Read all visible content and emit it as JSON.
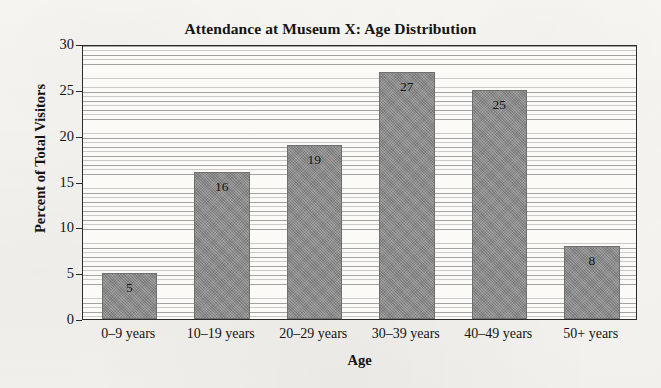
{
  "chart_data": {
    "type": "bar",
    "title": "Attendance at Museum X: Age Distribution",
    "xlabel": "Age",
    "ylabel": "Percent of Total Visitors",
    "categories": [
      "0–9 years",
      "10–19 years",
      "20–29 years",
      "30–39 years",
      "40–49 years",
      "50+ years"
    ],
    "values": [
      5,
      16,
      19,
      27,
      25,
      8
    ],
    "value_labels": [
      "5",
      "16",
      "19",
      "27",
      "25",
      "8"
    ],
    "ylim": [
      0,
      30
    ],
    "yticks": [
      0,
      5,
      10,
      15,
      20,
      25,
      30
    ],
    "ytick_labels": [
      "0",
      "5",
      "10",
      "15",
      "20",
      "25",
      "30"
    ],
    "grid": "horizontal-minor-every-1-unit",
    "legend": "none",
    "bar_color": "#8b8b8b",
    "bar_edge_color": "#6f6f6f",
    "plot_border_color": "#2b2b2b",
    "background_color": "#f7f6f2"
  }
}
